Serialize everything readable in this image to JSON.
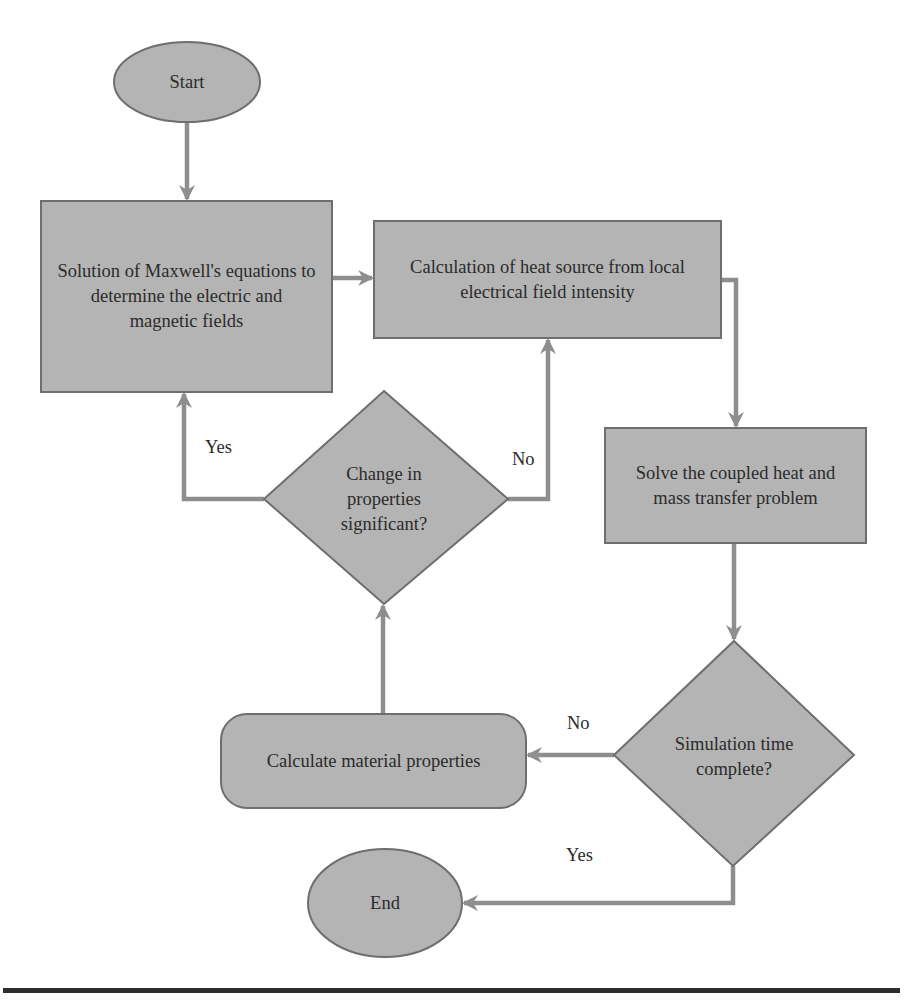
{
  "colors": {
    "node_fill": "#b4b4b4",
    "node_stroke": "#6e6e6e",
    "connector": "#8e8e8e",
    "text": "#2b2b2b",
    "rule": "#2d2d2d"
  },
  "nodes": {
    "start": {
      "label": "Start",
      "shape": "ellipse"
    },
    "maxwell": {
      "label": "Solution of Maxwell's equations to determine the electric and magnetic fields",
      "shape": "rectangle"
    },
    "heat_source": {
      "label": "Calculation of heat source from local electrical field intensity",
      "shape": "rectangle"
    },
    "solve_coupled": {
      "label": "Solve the coupled heat and mass transfer problem",
      "shape": "rectangle"
    },
    "change_decision": {
      "label": "Change in properties significant?",
      "shape": "diamond"
    },
    "sim_decision": {
      "label": "Simulation time complete?",
      "shape": "diamond"
    },
    "calc_material": {
      "label": "Calculate material properties",
      "shape": "rounded-rectangle"
    },
    "end": {
      "label": "End",
      "shape": "ellipse"
    }
  },
  "edges": [
    {
      "from": "start",
      "to": "maxwell",
      "label": ""
    },
    {
      "from": "maxwell",
      "to": "heat_source",
      "label": ""
    },
    {
      "from": "heat_source",
      "to": "solve_coupled",
      "label": ""
    },
    {
      "from": "solve_coupled",
      "to": "sim_decision",
      "label": ""
    },
    {
      "from": "sim_decision",
      "to": "calc_material",
      "label": "No"
    },
    {
      "from": "sim_decision",
      "to": "end",
      "label": "Yes"
    },
    {
      "from": "calc_material",
      "to": "change_decision",
      "label": ""
    },
    {
      "from": "change_decision",
      "to": "maxwell",
      "label": "Yes"
    },
    {
      "from": "change_decision",
      "to": "heat_source",
      "label": "No"
    }
  ],
  "edge_labels": {
    "change_yes": "Yes",
    "change_no": "No",
    "sim_no": "No",
    "sim_yes": "Yes"
  }
}
